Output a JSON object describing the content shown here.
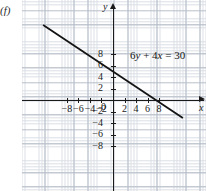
{
  "figure": {
    "part_label": "(f)",
    "background_color": "#ffffff",
    "grid_minor_color": "#cfd4dc",
    "grid_major_color": "#aeb6c2",
    "axis_color": "#1a1a1a",
    "line_color": "#141414"
  },
  "axes": {
    "x_axis_label": "x",
    "y_axis_label": "y",
    "origin_label": "0",
    "x_ticks": [
      {
        "value": -8,
        "label": "−8"
      },
      {
        "value": -6,
        "label": "−6"
      },
      {
        "value": -4,
        "label": "−4"
      },
      {
        "value": -2,
        "label": "−2"
      },
      {
        "value": 2,
        "label": "2"
      },
      {
        "value": 4,
        "label": "4"
      },
      {
        "value": 6,
        "label": "6"
      },
      {
        "value": 8,
        "label": "8"
      }
    ],
    "y_ticks": [
      {
        "value": 8,
        "label": "8"
      },
      {
        "value": 6,
        "label": "6"
      },
      {
        "value": 4,
        "label": "4"
      },
      {
        "value": 2,
        "label": "2"
      },
      {
        "value": -2,
        "label": "−2"
      },
      {
        "value": -4,
        "label": "−4"
      },
      {
        "value": -6,
        "label": "−6"
      },
      {
        "value": -8,
        "label": "−8"
      }
    ]
  },
  "annotation": {
    "equation_lead": "6",
    "equation_var_y": "y",
    "equation_plus": " + ",
    "equation_coeff_x": "4",
    "equation_var_x": "x",
    "equation_equals": " = ",
    "equation_value": "30",
    "equation_full": "6y + 4x = 30"
  },
  "chart_data": {
    "type": "line",
    "title": "",
    "xlabel": "x",
    "ylabel": "y",
    "xlim": [
      -10.5,
      10.5
    ],
    "ylim": [
      -9.5,
      9.5
    ],
    "grid": true,
    "legend": "none",
    "series": [
      {
        "name": "6y + 4x = 30",
        "equation": "6y + 4x = 30",
        "slope": -0.6667,
        "intercept": 5,
        "x_intercept": 7.5,
        "y_intercept": 5,
        "points": [
          {
            "x": -12,
            "y": 13
          },
          {
            "x": -9,
            "y": 11
          },
          {
            "x": -6,
            "y": 9
          },
          {
            "x": -3,
            "y": 7
          },
          {
            "x": 0,
            "y": 5
          },
          {
            "x": 3,
            "y": 3
          },
          {
            "x": 6,
            "y": 1
          },
          {
            "x": 7.5,
            "y": 0
          },
          {
            "x": 9,
            "y": -1
          },
          {
            "x": 12,
            "y": -3
          }
        ]
      }
    ],
    "annotations": [
      {
        "text": "6y + 4x = 30",
        "x": 3.0,
        "y": 4.4
      }
    ]
  }
}
